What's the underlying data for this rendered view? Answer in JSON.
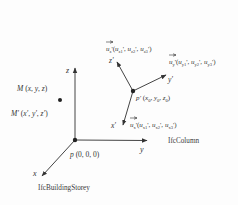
{
  "diagram": {
    "type": "coordinate-system-transformation",
    "global_frame": {
      "name": "IfcBuildingStorey",
      "origin_label": "p (0, 0, 0)",
      "axes": {
        "x": "x",
        "y": "y",
        "z": "z"
      }
    },
    "local_frame": {
      "name": "IfcColumn",
      "origin_label": "p' (x0, y0, z0)",
      "axes": {
        "x": "x'",
        "y": "y'",
        "z": "z'"
      },
      "unit_vectors": {
        "x": "u'x (u'x1, u'x2, u'x3)",
        "y": "u'y (u'y1, u'y2, u'y3)",
        "z": "u'z (u'z1, u'z2, u'z3)"
      }
    },
    "point": {
      "global_label": "M (x, y, z)",
      "local_label": "M' (x', y', z')"
    },
    "colors": {
      "line": "#444444",
      "text": "#333333",
      "background": "#fdfdfd"
    }
  }
}
